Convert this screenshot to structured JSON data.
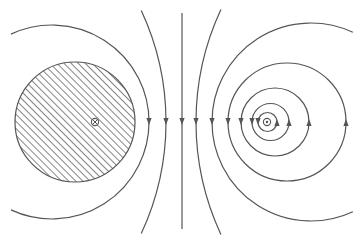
{
  "diagram": {
    "description": "Magnetic field lines of two antiparallel current-carrying conductors",
    "colors": {
      "line": "#555555",
      "hatch": "#666666",
      "background": "#ffffff"
    },
    "left_conductor": {
      "symbol": "⊗",
      "meaning": "current-into-page",
      "shape": "hatched-disk",
      "center": [
        75,
        122
      ],
      "radius": 60,
      "symbol_position": [
        95,
        122
      ]
    },
    "right_conductor": {
      "symbol": "⊙",
      "meaning": "current-out-of-page",
      "center": [
        267,
        122
      ]
    },
    "field_lines": {
      "midline": {
        "x": 182,
        "y1": 13,
        "y2": 229,
        "arrow": "down"
      },
      "left_arcs": [
        {
          "cx": 52,
          "cy": 122,
          "r": 97,
          "arrow_x": 149,
          "arrow": "down"
        },
        {
          "cx": -98,
          "cy": 122,
          "r": 264,
          "arrow_x": 166,
          "arrow": "down"
        }
      ],
      "right_arcs": [
        {
          "cx": 462,
          "cy": 122,
          "r": 266,
          "arrow_x": 196,
          "arrow": "down"
        },
        {
          "cx": 311,
          "cy": 122,
          "r": 99,
          "arrow_x": 212,
          "arrow": "down"
        }
      ],
      "right_circles": [
        {
          "cx": 267.5,
          "cy": 122,
          "r": 9.5
        },
        {
          "cx": 270.5,
          "cy": 122,
          "r": 18.5
        },
        {
          "cx": 275,
          "cy": 122,
          "r": 34
        },
        {
          "cx": 287,
          "cy": 122,
          "r": 59
        }
      ]
    }
  }
}
